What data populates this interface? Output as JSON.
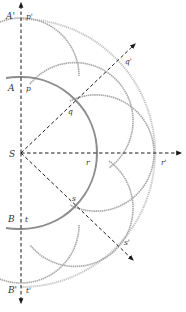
{
  "diagram": {
    "type": "Huygens wave-front construction (spherical wavefront)",
    "source": {
      "label": "S"
    },
    "primary_wavefront_points": [
      {
        "id": "A",
        "label": "A",
        "secondary_label": "p"
      },
      {
        "id": "q",
        "label": "q"
      },
      {
        "id": "r",
        "label": "r"
      },
      {
        "id": "s",
        "label": "s"
      },
      {
        "id": "B",
        "label": "B",
        "secondary_label": "t"
      }
    ],
    "new_wavefront_points": [
      {
        "id": "A_prime",
        "label": "A'",
        "secondary_label": "p'"
      },
      {
        "id": "q_prime",
        "label": "q'"
      },
      {
        "id": "r_prime",
        "label": "r'"
      },
      {
        "id": "s_prime",
        "label": "s'"
      },
      {
        "id": "B_prime",
        "label": "B'",
        "secondary_label": "t'"
      }
    ],
    "colors": {
      "primary_wavefront": "#8c8c8c",
      "secondary_wavelets": "#a8a8a8",
      "new_wavefront": "#c4c4c4",
      "rays": "#1a1a1a"
    }
  }
}
